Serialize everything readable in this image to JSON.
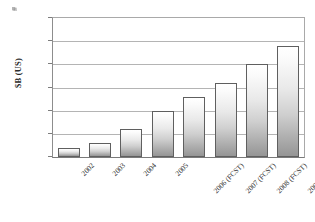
{
  "chart_data": {
    "type": "bar",
    "title": "",
    "xlabel": "",
    "ylabel": "$B (US)",
    "categories": [
      "2002",
      "2003",
      "2004",
      "2005",
      "2006 (FCST)",
      "2007 (FCST)",
      "2008 (FCST)",
      "2009 (FCST)"
    ],
    "values": [
      0.2,
      0.3,
      0.6,
      1.0,
      1.3,
      1.6,
      2.0,
      2.4
    ],
    "ylim": [
      0.0,
      3.0
    ],
    "ytick_values": [
      3.0,
      2.5,
      2.0,
      1.5,
      1.0,
      0.5,
      0.0
    ],
    "ytick_labels": [
      "$3.0",
      "$2.5",
      "$2.0",
      "$1.5",
      "$1.0",
      "$0.5",
      "$0.0"
    ],
    "grid": true,
    "legend": false,
    "legend_position": "none",
    "bar_fill": "vertical gradient white to gray",
    "colors": {
      "bar_top": "#ffffff",
      "bar_bottom": "#959595",
      "bar_border": "#5f5f5f",
      "gridline": "#b4b4b4",
      "axis": "#7a7a7a",
      "text": "#2b2b2b",
      "background": "#ffffff"
    }
  }
}
